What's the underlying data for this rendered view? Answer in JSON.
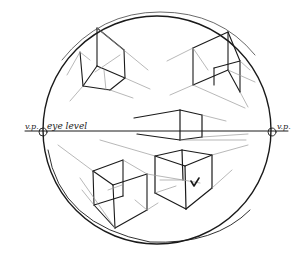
{
  "figure": {
    "labels": {
      "vp_left": "v.p.",
      "eye_level": "eye level",
      "vp_right": "v.p."
    },
    "elements": [
      "horizon-line",
      "left-vanishing-point",
      "right-vanishing-point",
      "bounding-circle",
      "cube-above-left",
      "cube-above-right",
      "cube-on-horizon",
      "cube-below-left",
      "cube-below-right",
      "check-mark"
    ],
    "colors": {
      "ink": "#1a1a1a",
      "guide": "#9a9a9a",
      "paper": "#ffffff"
    }
  }
}
